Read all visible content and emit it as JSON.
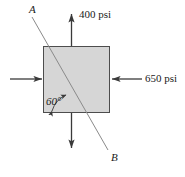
{
  "figure": {
    "type": "stress-element-diagram",
    "element": {
      "shape": "square",
      "fill_color": "#d6d6d6",
      "stroke_color": "#4d4d4d",
      "x": 43,
      "y": 46,
      "width": 67,
      "height": 67
    },
    "stresses": [
      {
        "name": "top-stress",
        "label": "400 psi",
        "direction": "up",
        "sense": "tension",
        "magnitude": 400,
        "units": "psi",
        "face": "top"
      },
      {
        "name": "bottom-stress",
        "label": "",
        "direction": "down",
        "sense": "tension",
        "magnitude": 400,
        "units": "psi",
        "face": "bottom"
      },
      {
        "name": "right-stress",
        "label": "650 psi",
        "direction": "left",
        "sense": "compression",
        "magnitude": 650,
        "units": "psi",
        "face": "right"
      },
      {
        "name": "left-stress",
        "label": "",
        "direction": "right",
        "sense": "compression",
        "magnitude": 650,
        "units": "psi",
        "face": "left"
      }
    ],
    "inclined_plane": {
      "label_top": "A",
      "label_bottom": "B",
      "angle_label": "60°",
      "angle_value": 60,
      "angle_units": "degrees",
      "measured_from": "bottom-edge",
      "line_color": "#808080"
    },
    "colors": {
      "element_fill": "#d6d6d6",
      "element_stroke": "#4d4d4d",
      "arrow": "#3a3a3a",
      "plane_line": "#808080",
      "text": "#1a1a1a"
    }
  }
}
